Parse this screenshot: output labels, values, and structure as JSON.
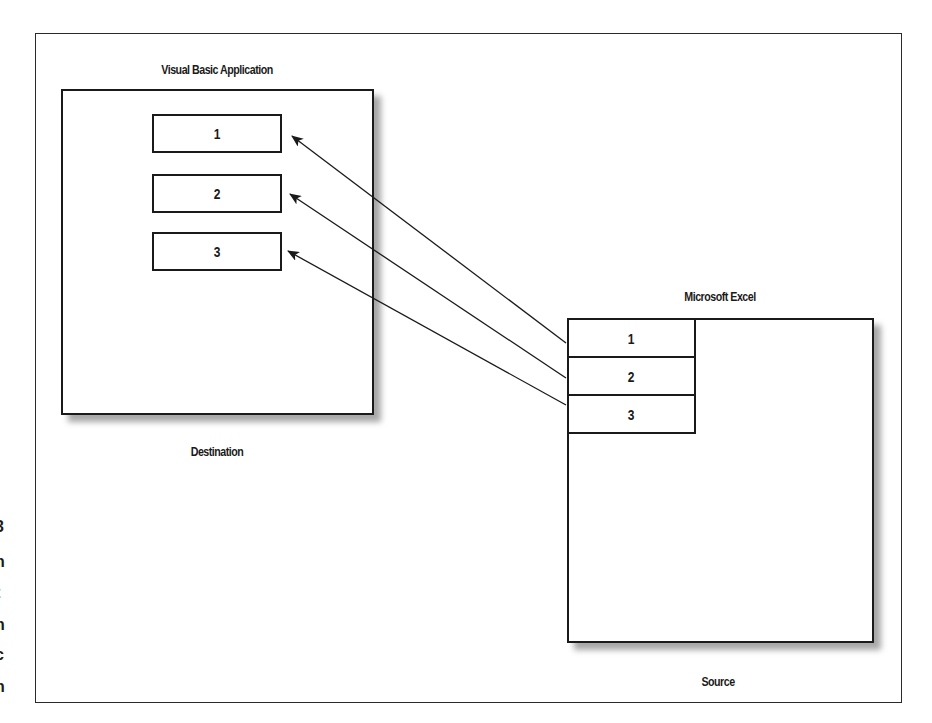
{
  "diagram": {
    "type": "data-link diagram",
    "destination": {
      "title": "Visual Basic Application",
      "caption": "Destination",
      "fields": [
        {
          "label": "1"
        },
        {
          "label": "2"
        },
        {
          "label": "3"
        }
      ]
    },
    "source": {
      "title": "Microsoft Excel",
      "caption": "Source",
      "cells": [
        {
          "label": "1"
        },
        {
          "label": "2"
        },
        {
          "label": "3"
        }
      ]
    },
    "links": [
      {
        "from": "source.cells.0",
        "to": "destination.fields.0"
      },
      {
        "from": "source.cells.1",
        "to": "destination.fields.1"
      },
      {
        "from": "source.cells.2",
        "to": "destination.fields.2"
      }
    ],
    "clipped_margin_text": [
      "3",
      "n",
      "t",
      "n",
      "c",
      "n"
    ]
  },
  "colors": {
    "line": "#1a1a1a",
    "background": "#ffffff",
    "shadow": "#9a9a9a"
  }
}
